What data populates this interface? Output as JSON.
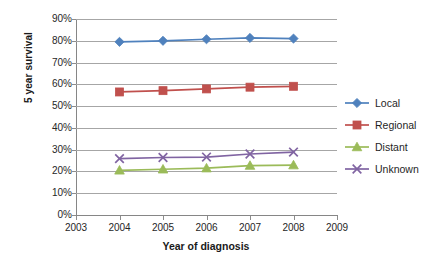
{
  "chart_data": {
    "type": "line",
    "title": "",
    "xlabel": "Year of diagnosis",
    "ylabel": "5 year survival",
    "x": [
      2004,
      2005,
      2006,
      2007,
      2008
    ],
    "categories": [
      "2004",
      "2005",
      "2006",
      "2007",
      "2008"
    ],
    "xlim": [
      2003,
      2009
    ],
    "ylim": [
      0,
      90
    ],
    "x_tick_labels": [
      "2003",
      "2004",
      "2005",
      "2006",
      "2007",
      "2008",
      "2009"
    ],
    "y_tick_labels": [
      "0%",
      "10%",
      "20%",
      "30%",
      "40%",
      "50%",
      "60%",
      "70%",
      "80%",
      "90%"
    ],
    "y_tick_values": [
      0,
      10,
      20,
      30,
      40,
      50,
      60,
      70,
      80,
      90
    ],
    "grid": true,
    "legend_position": "right",
    "series": [
      {
        "name": "Local",
        "marker": "diamond",
        "color": "#4F81BD",
        "values": [
          79.5,
          80.0,
          80.7,
          81.3,
          81.0
        ]
      },
      {
        "name": "Regional",
        "marker": "square",
        "color": "#C0504D",
        "values": [
          56.5,
          57.1,
          57.9,
          58.7,
          59.1
        ]
      },
      {
        "name": "Distant",
        "marker": "triangle",
        "color": "#9BBB59",
        "values": [
          20.5,
          21.0,
          21.5,
          22.7,
          22.9
        ]
      },
      {
        "name": "Unknown",
        "marker": "x",
        "color": "#8064A2",
        "values": [
          25.9,
          26.4,
          26.6,
          28.0,
          28.9
        ]
      }
    ]
  },
  "axes": {
    "y_title": "5 year survival",
    "x_title": "Year of diagnosis"
  },
  "legend": {
    "items": [
      {
        "label": "Local",
        "color": "#4F81BD",
        "marker": "diamond"
      },
      {
        "label": "Regional",
        "color": "#C0504D",
        "marker": "square"
      },
      {
        "label": "Distant",
        "color": "#9BBB59",
        "marker": "triangle"
      },
      {
        "label": "Unknown",
        "color": "#8064A2",
        "marker": "x"
      }
    ]
  },
  "colors": {
    "local": "#4F81BD",
    "regional": "#C0504D",
    "distant": "#9BBB59",
    "unknown": "#8064A2",
    "gridline": "#a6a6a6",
    "axis": "#868686",
    "text": "#262626",
    "background": "#ffffff"
  }
}
